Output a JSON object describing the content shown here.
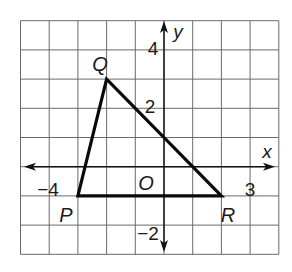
{
  "figure": {
    "grid": {
      "x_min": -5,
      "x_max": 4,
      "y_min": -3,
      "y_max": 5,
      "origin_px": [
        164,
        166.7
      ],
      "cell_w": 28.7,
      "cell_h": 29.2,
      "line_color": "#6a6a6a"
    },
    "axes": {
      "x_label": "x",
      "y_label": "y",
      "origin_label": "O",
      "x_extent_px": [
        24,
        275
      ],
      "y_extent_px": [
        21,
        252
      ],
      "color": "#111111"
    },
    "tick_labels": [
      {
        "text": "−4",
        "x": 48,
        "y": 196,
        "anchor": "middle"
      },
      {
        "text": "3",
        "x": 250,
        "y": 196,
        "anchor": "middle"
      },
      {
        "text": "4",
        "x": 153,
        "y": 55,
        "anchor": "middle"
      },
      {
        "text": "2",
        "x": 150,
        "y": 113,
        "anchor": "middle"
      },
      {
        "text": "−2",
        "x": 148,
        "y": 240,
        "anchor": "middle"
      }
    ],
    "axis_name_pos": {
      "x": {
        "x": 267,
        "y": 158
      },
      "y": {
        "x": 178,
        "y": 38
      },
      "O": {
        "x": 146,
        "y": 190
      }
    },
    "triangle": {
      "vertices": [
        {
          "name": "P",
          "coord": [
            -3,
            -1
          ],
          "label_px": [
            66,
            222
          ]
        },
        {
          "name": "Q",
          "coord": [
            -2,
            3
          ],
          "label_px": [
            100,
            71
          ]
        },
        {
          "name": "R",
          "coord": [
            2,
            -1
          ],
          "label_px": [
            228,
            222
          ]
        }
      ],
      "stroke": "#0a0a0a"
    }
  }
}
